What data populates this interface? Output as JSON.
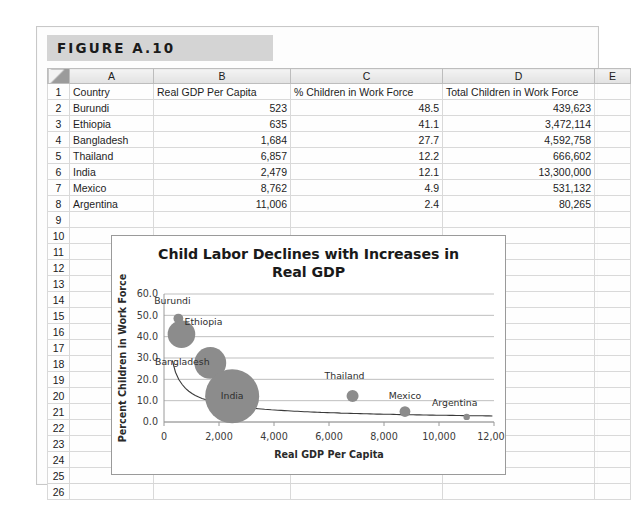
{
  "figure": {
    "caption": "FIGURE A.10"
  },
  "sheet": {
    "column_headers": [
      "A",
      "B",
      "C",
      "D",
      "E"
    ],
    "row_numbers": [
      "1",
      "2",
      "3",
      "4",
      "5",
      "6",
      "7",
      "8",
      "9",
      "10",
      "11",
      "12",
      "13",
      "14",
      "15",
      "16",
      "17",
      "18",
      "19",
      "20",
      "21",
      "22",
      "23",
      "24",
      "25",
      "26"
    ],
    "header_row": {
      "a": "Country",
      "b": "Real GDP Per Capita",
      "c": "% Children in Work Force",
      "d": "Total Children in Work Force",
      "e": ""
    },
    "rows": [
      {
        "row": "2",
        "a": "Burundi",
        "b": "523",
        "c": "48.5",
        "d": "439,623"
      },
      {
        "row": "3",
        "a": "Ethiopia",
        "b": "635",
        "c": "41.1",
        "d": "3,472,114"
      },
      {
        "row": "4",
        "a": "Bangladesh",
        "b": "1,684",
        "c": "27.7",
        "d": "4,592,758"
      },
      {
        "row": "5",
        "a": "Thailand",
        "b": "6,857",
        "c": "12.2",
        "d": "666,602"
      },
      {
        "row": "6",
        "a": "India",
        "b": "2,479",
        "c": "12.1",
        "d": "13,300,000"
      },
      {
        "row": "7",
        "a": "Mexico",
        "b": "8,762",
        "c": "4.9",
        "d": "531,132"
      },
      {
        "row": "8",
        "a": "Argentina",
        "b": "11,006",
        "c": "2.4",
        "d": "80,265"
      }
    ]
  },
  "chart_data": {
    "type": "scatter",
    "title_lines": [
      "Child Labor Declines with Increases in",
      "Real GDP"
    ],
    "xlabel": "Real GDP Per Capita",
    "ylabel": "Percent Children in Work Force",
    "xlim": [
      0,
      12000
    ],
    "ylim": [
      0,
      60
    ],
    "xticks": [
      "0",
      "2,000",
      "4,000",
      "6,000",
      "8,000",
      "10,000",
      "12,000"
    ],
    "xtick_values": [
      0,
      2000,
      4000,
      6000,
      8000,
      10000,
      12000
    ],
    "yticks": [
      "0.0",
      "10.0",
      "20.0",
      "30.0",
      "40.0",
      "50.0",
      "60.0"
    ],
    "ytick_values": [
      0,
      10,
      20,
      30,
      40,
      50,
      60
    ],
    "grid": "horizontal",
    "legend": "none",
    "bubble_color": "#8c8c8c",
    "size_field": "Total Children in Work Force",
    "points": [
      {
        "label": "Burundi",
        "x": 523,
        "y": 48.5,
        "size": 439623,
        "label_dx": -6,
        "label_dy": -12
      },
      {
        "label": "Ethiopia",
        "x": 635,
        "y": 41.1,
        "size": 3472114,
        "label_dx": 22,
        "label_dy": -2
      },
      {
        "label": "Bangladesh",
        "x": 1684,
        "y": 27.7,
        "size": 4592758,
        "label_dx": -28,
        "label_dy": 2
      },
      {
        "label": "Thailand",
        "x": 6857,
        "y": 12.2,
        "size": 666602,
        "label_dx": -8,
        "label_dy": -14
      },
      {
        "label": "India",
        "x": 2479,
        "y": 12.1,
        "size": 13300000,
        "label_dx": 0,
        "label_dy": 3
      },
      {
        "label": "Mexico",
        "x": 8762,
        "y": 4.9,
        "size": 531132,
        "label_dx": 0,
        "label_dy": -10
      },
      {
        "label": "Argentina",
        "x": 11006,
        "y": 2.4,
        "size": 80265,
        "label_dx": -12,
        "label_dy": -9
      }
    ],
    "trendline": {
      "shown": true,
      "type": "power",
      "description": "declining curve from upper-left to lower-right"
    }
  }
}
